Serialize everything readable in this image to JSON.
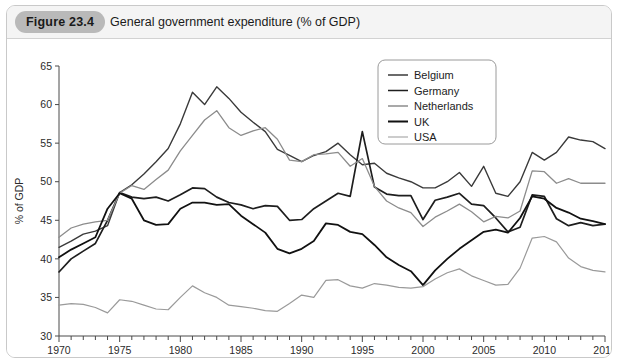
{
  "figure": {
    "badge": "Figure 23.4",
    "title": "General government expenditure (% of GDP)"
  },
  "chart_data": {
    "type": "line",
    "title": "General government expenditure (% of GDP)",
    "xlabel": "",
    "ylabel": "% of GDP",
    "xlim": [
      1970,
      2015
    ],
    "ylim": [
      30,
      65
    ],
    "ytick_labels": [
      "30",
      "35",
      "40",
      "45",
      "50",
      "55",
      "60",
      "65"
    ],
    "yticks": [
      30,
      35,
      40,
      45,
      50,
      55,
      60,
      65
    ],
    "xtick_labels": [
      "1970",
      "1975",
      "1980",
      "1985",
      "1990",
      "1995",
      "2000",
      "2005",
      "2010",
      "2015"
    ],
    "xticks": [
      1970,
      1975,
      1980,
      1985,
      1990,
      1995,
      2000,
      2005,
      2010,
      2015
    ],
    "minor_xtick_interval": 1,
    "grid": false,
    "legend_position": "top-right",
    "x": [
      1970,
      1971,
      1972,
      1973,
      1974,
      1975,
      1976,
      1977,
      1978,
      1979,
      1980,
      1981,
      1982,
      1983,
      1984,
      1985,
      1986,
      1987,
      1988,
      1989,
      1990,
      1991,
      1992,
      1993,
      1994,
      1995,
      1996,
      1997,
      1998,
      1999,
      2000,
      2001,
      2002,
      2003,
      2004,
      2005,
      2006,
      2007,
      2008,
      2009,
      2010,
      2011,
      2012,
      2013,
      2014,
      2015
    ],
    "series": [
      {
        "name": "Belgium",
        "color": "#3a3a3a",
        "width": 1.4,
        "values": [
          41.5,
          42.3,
          43.2,
          43.6,
          44.3,
          48.6,
          49.6,
          51.0,
          52.6,
          54.3,
          57.5,
          61.6,
          60.0,
          62.3,
          60.8,
          59.0,
          57.7,
          56.5,
          54.2,
          53.4,
          52.6,
          53.4,
          53.9,
          55.0,
          53.5,
          52.2,
          52.4,
          51.1,
          50.5,
          50.0,
          49.2,
          49.2,
          50.0,
          51.2,
          49.4,
          52.0,
          48.5,
          48.1,
          50.0,
          53.8,
          52.8,
          53.8,
          55.8,
          55.4,
          55.2,
          54.3
        ]
      },
      {
        "name": "Germany",
        "color": "#1e1e1e",
        "width": 1.7,
        "values": [
          38.3,
          40.0,
          41.0,
          42.0,
          45.0,
          48.6,
          48.0,
          47.8,
          48.0,
          47.5,
          48.3,
          49.2,
          49.1,
          48.0,
          47.3,
          47.0,
          46.5,
          46.9,
          46.8,
          45.0,
          45.1,
          46.5,
          47.5,
          48.5,
          48.1,
          56.5,
          49.3,
          48.4,
          48.2,
          48.2,
          45.1,
          47.6,
          48.0,
          48.5,
          47.1,
          46.9,
          45.3,
          43.5,
          44.1,
          48.3,
          48.1,
          45.2,
          44.3,
          44.7,
          44.3,
          44.5
        ]
      },
      {
        "name": "Netherlands",
        "color": "#8c8c8c",
        "width": 1.3,
        "values": [
          42.8,
          44.0,
          44.5,
          44.8,
          45.0,
          48.5,
          49.5,
          49.0,
          50.3,
          51.5,
          54.0,
          56.0,
          58.0,
          59.2,
          57.0,
          56.0,
          56.6,
          57.0,
          55.5,
          52.8,
          52.6,
          53.5,
          53.6,
          53.8,
          52.0,
          53.0,
          49.4,
          47.5,
          46.6,
          46.0,
          44.2,
          45.4,
          46.2,
          47.1,
          46.1,
          44.8,
          45.5,
          45.3,
          46.2,
          51.4,
          51.3,
          49.8,
          50.4,
          49.8,
          49.8,
          49.8
        ]
      },
      {
        "name": "UK",
        "color": "#111111",
        "width": 1.8,
        "values": [
          40.2,
          41.2,
          42.0,
          42.8,
          46.5,
          48.5,
          47.8,
          45.0,
          44.4,
          44.5,
          46.5,
          47.3,
          47.3,
          47.0,
          47.1,
          45.6,
          44.5,
          43.4,
          41.3,
          40.7,
          41.3,
          42.3,
          44.6,
          44.4,
          43.5,
          43.2,
          41.8,
          40.2,
          39.2,
          38.4,
          36.6,
          38.5,
          40.0,
          41.3,
          42.4,
          43.5,
          43.8,
          43.4,
          45.3,
          48.1,
          47.8,
          46.6,
          46.0,
          45.2,
          44.9,
          44.5
        ]
      },
      {
        "name": "USA",
        "color": "#9a9a9a",
        "width": 1.2,
        "values": [
          34.0,
          34.2,
          34.1,
          33.7,
          33.0,
          34.7,
          34.5,
          34.0,
          33.5,
          33.4,
          35.0,
          36.5,
          35.6,
          35.0,
          34.0,
          33.8,
          33.6,
          33.3,
          33.2,
          34.2,
          35.3,
          35.0,
          37.2,
          37.3,
          36.5,
          36.2,
          36.8,
          36.6,
          36.3,
          36.2,
          36.4,
          37.4,
          38.2,
          38.7,
          37.8,
          37.2,
          36.6,
          36.7,
          38.8,
          42.7,
          42.9,
          42.2,
          40.1,
          39.0,
          38.5,
          38.3
        ]
      }
    ]
  },
  "legend": {
    "entries": [
      {
        "label": "Belgium"
      },
      {
        "label": "Germany"
      },
      {
        "label": "Netherlands"
      },
      {
        "label": "UK"
      },
      {
        "label": "USA"
      }
    ]
  }
}
